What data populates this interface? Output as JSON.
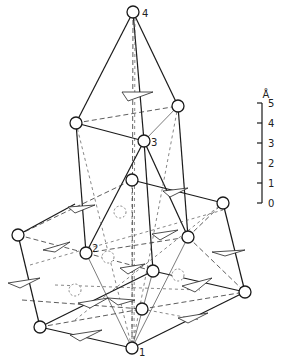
{
  "diagram": {
    "type": "crystal-structure-perspective",
    "atom_labels": {
      "a1": "1",
      "a2": "2",
      "a3": "3",
      "a4": "4"
    },
    "scale_bar": {
      "unit": "Å",
      "ticks": [
        "5",
        "4",
        "3",
        "2",
        "1",
        "0"
      ]
    }
  }
}
